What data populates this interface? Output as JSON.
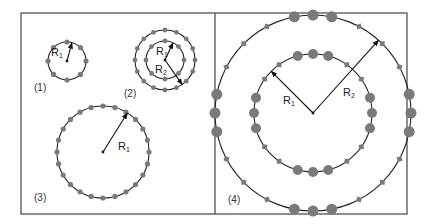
{
  "figure": {
    "frame": {
      "x": 21,
      "y": 13,
      "width": 386,
      "height": 201,
      "divider_x": 215
    },
    "colors": {
      "line": "#222222",
      "dot": "#7a7a7a",
      "frame": "#444444",
      "text": "#333333"
    },
    "panels": [
      {
        "id": "1",
        "label": "(1)",
        "label_pos": [
          34,
          91
        ],
        "center": [
          67,
          61
        ],
        "rings": [
          {
            "r": 19,
            "dots": 8,
            "dot_r": 2.6,
            "offset_deg": 0
          }
        ],
        "radii": [
          {
            "name": "R",
            "sub": "1",
            "to_ring": 0,
            "angle_deg": -75,
            "label_pos": [
              51,
              56
            ]
          }
        ]
      },
      {
        "id": "2",
        "label": "(2)",
        "label_pos": [
          124,
          97
        ],
        "center": [
          165,
          60
        ],
        "rings": [
          {
            "r": 19,
            "dots": 8,
            "dot_r": 2.4,
            "offset_deg": 0
          },
          {
            "r": 30,
            "dots": 16,
            "dot_r": 2.4,
            "offset_deg": 0
          }
        ],
        "radii": [
          {
            "name": "R",
            "sub": "1",
            "to_ring": 0,
            "angle_deg": -65,
            "label_pos": [
              156,
              55
            ]
          },
          {
            "name": "R",
            "sub": "2",
            "to_ring": 1,
            "angle_deg": 55,
            "label_pos": [
              155,
              73
            ]
          }
        ]
      },
      {
        "id": "3",
        "label": "(3)",
        "label_pos": [
          34,
          201
        ],
        "center": [
          103,
          152
        ],
        "rings": [
          {
            "r": 46,
            "dots": 24,
            "dot_r": 2.6,
            "offset_deg": 0
          }
        ],
        "radii": [
          {
            "name": "R",
            "sub": "1",
            "to_ring": 0,
            "angle_deg": -58,
            "label_pos": [
              118,
              150
            ]
          }
        ]
      },
      {
        "id": "4",
        "label": "(4)",
        "label_pos": [
          228,
          203
        ],
        "center": [
          313,
          113
        ],
        "rings": [
          {
            "r": 59,
            "big_dot_r": 5,
            "small_sq": 2.4,
            "big_groups_deg": [
              -90,
              0,
              90,
              180
            ],
            "big_step_deg": 15,
            "small_per_quadrant": 2
          },
          {
            "r": 98,
            "big_dot_r": 5.5,
            "small_sq": 2.4,
            "big_groups_deg": [
              -90,
              0,
              90,
              180
            ],
            "big_step_deg": 11,
            "small_per_quadrant": 3
          }
        ],
        "radii": [
          {
            "name": "R",
            "sub": "1",
            "to_ring": 0,
            "angle_deg": -135,
            "label_pos": [
              283,
              104
            ]
          },
          {
            "name": "R",
            "sub": "2",
            "to_ring": 1,
            "angle_deg": -48,
            "label_pos": [
              343,
              96
            ]
          }
        ]
      }
    ]
  }
}
